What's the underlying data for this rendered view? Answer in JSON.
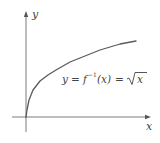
{
  "figure": {
    "type": "function-graph",
    "axes": {
      "x_label": "x",
      "y_label": "y",
      "color": "#6b6b6b"
    },
    "curve": {
      "color": "#5a5a5a",
      "function": "sqrt",
      "points": [
        [
          26,
          117
        ],
        [
          27,
          110
        ],
        [
          29,
          100
        ],
        [
          33,
          90
        ],
        [
          40,
          81
        ],
        [
          48,
          75
        ],
        [
          56,
          70
        ],
        [
          70,
          62
        ],
        [
          80,
          58
        ],
        [
          90,
          54
        ],
        [
          100,
          50
        ],
        [
          110,
          47
        ],
        [
          120,
          44
        ],
        [
          128,
          42.5
        ],
        [
          136,
          41
        ]
      ]
    },
    "equation": {
      "lhs": "y",
      "eq1": "=",
      "f": "f",
      "inverse_exp": "−1",
      "arg": "(x)",
      "eq2": "=",
      "radicand": "x",
      "full_text": "y = f⁻¹(x) = √x"
    }
  }
}
